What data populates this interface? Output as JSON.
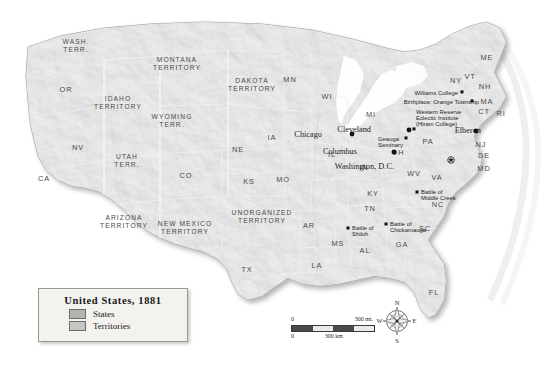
{
  "map": {
    "title": "United States, 1881",
    "legend": {
      "title": "United States,  1881",
      "items": [
        {
          "label": "States",
          "color": "#b3b3b3"
        },
        {
          "label": "Territories",
          "color": "#c6c6c6"
        }
      ]
    },
    "scale": {
      "miles_zero": "0",
      "miles_value": "300 mi.",
      "km_zero": "0",
      "km_value": "300 km"
    },
    "compass": {
      "north": "N",
      "east": "E",
      "south": "S",
      "west": "W"
    },
    "states": [
      {
        "abbr": "OR",
        "x": 66,
        "y": 92
      },
      {
        "abbr": "CA",
        "x": 44,
        "y": 181
      },
      {
        "abbr": "NV",
        "x": 78,
        "y": 150
      },
      {
        "abbr": "MN",
        "x": 290,
        "y": 82
      },
      {
        "abbr": "WI",
        "x": 327,
        "y": 99
      },
      {
        "abbr": "MI",
        "x": 371,
        "y": 117
      },
      {
        "abbr": "IA",
        "x": 272,
        "y": 140
      },
      {
        "abbr": "NE",
        "x": 238,
        "y": 152
      },
      {
        "abbr": "CO",
        "x": 186,
        "y": 178
      },
      {
        "abbr": "KS",
        "x": 249,
        "y": 184
      },
      {
        "abbr": "MO",
        "x": 283,
        "y": 182
      },
      {
        "abbr": "IL",
        "x": 332,
        "y": 157
      },
      {
        "abbr": "IN",
        "x": 364,
        "y": 170
      },
      {
        "abbr": "OH",
        "x": 398,
        "y": 155
      },
      {
        "abbr": "PA",
        "x": 428,
        "y": 144
      },
      {
        "abbr": "KY",
        "x": 373,
        "y": 196
      },
      {
        "abbr": "TN",
        "x": 370,
        "y": 211
      },
      {
        "abbr": "AR",
        "x": 309,
        "y": 228
      },
      {
        "abbr": "MS",
        "x": 338,
        "y": 246
      },
      {
        "abbr": "AL",
        "x": 365,
        "y": 253
      },
      {
        "abbr": "GA",
        "x": 402,
        "y": 247
      },
      {
        "abbr": "SC",
        "x": 425,
        "y": 231
      },
      {
        "abbr": "NC",
        "x": 438,
        "y": 207
      },
      {
        "abbr": "VA",
        "x": 437,
        "y": 180
      },
      {
        "abbr": "WV",
        "x": 414,
        "y": 176
      },
      {
        "abbr": "LA",
        "x": 317,
        "y": 268
      },
      {
        "abbr": "TX",
        "x": 247,
        "y": 272
      },
      {
        "abbr": "FL",
        "x": 434,
        "y": 295
      },
      {
        "abbr": "ME",
        "x": 487,
        "y": 60
      },
      {
        "abbr": "VT",
        "x": 470,
        "y": 79
      },
      {
        "abbr": "NH",
        "x": 485,
        "y": 89
      },
      {
        "abbr": "NY",
        "x": 456,
        "y": 83
      },
      {
        "abbr": "MA",
        "x": 487,
        "y": 104
      },
      {
        "abbr": "CT",
        "x": 484,
        "y": 114
      },
      {
        "abbr": "RI",
        "x": 501,
        "y": 116
      },
      {
        "abbr": "NJ",
        "x": 481,
        "y": 147
      },
      {
        "abbr": "DE",
        "x": 484,
        "y": 158
      },
      {
        "abbr": "MD",
        "x": 484,
        "y": 171
      }
    ],
    "territories": [
      {
        "lines": [
          "WASH.",
          "TERR."
        ],
        "x": 76,
        "y": 44
      },
      {
        "lines": [
          "MONTANA",
          "TERRITORY"
        ],
        "x": 177,
        "y": 62
      },
      {
        "lines": [
          "DAKOTA",
          "TERRITORY"
        ],
        "x": 252,
        "y": 83
      },
      {
        "lines": [
          "IDAHO",
          "TERRITORY"
        ],
        "x": 118,
        "y": 101
      },
      {
        "lines": [
          "WYOMING",
          "TERR."
        ],
        "x": 172,
        "y": 119
      },
      {
        "lines": [
          "UTAH",
          "TERR."
        ],
        "x": 127,
        "y": 159
      },
      {
        "lines": [
          "ARIZONA",
          "TERRITORY"
        ],
        "x": 124,
        "y": 220
      },
      {
        "lines": [
          "NEW MEXICO",
          "TERRITORY"
        ],
        "x": 185,
        "y": 226
      },
      {
        "lines": [
          "UNORGANIZED",
          "TERRITORY"
        ],
        "x": 262,
        "y": 215
      }
    ],
    "cities": [
      {
        "name": "Chicago",
        "label_x": 322,
        "label_y": 137,
        "dot_x": 352,
        "dot_y": 134,
        "anchor": "start",
        "marker": "dot"
      },
      {
        "name": "Cleveland",
        "label_x": 371,
        "label_y": 132,
        "dot_x": 409,
        "dot_y": 130,
        "anchor": "start",
        "marker": "dot"
      },
      {
        "name": "Columbus",
        "label_x": 357,
        "label_y": 154,
        "dot_x": 394,
        "dot_y": 152,
        "anchor": "start",
        "marker": "dot"
      },
      {
        "name": "Washington, D.C.",
        "label_x": 394,
        "label_y": 169,
        "dot_x": 451,
        "dot_y": 160,
        "anchor": "start",
        "marker": "star"
      },
      {
        "name": "Elberon",
        "label_x": 481,
        "label_y": 133,
        "dot_x": 476,
        "dot_y": 131,
        "anchor": "start",
        "marker": "dot"
      }
    ],
    "annotations": [
      {
        "lines": [
          "Williams College"
        ],
        "x": 458,
        "y": 95,
        "anchor": "end",
        "dot_x": 462,
        "dot_y": 95
      },
      {
        "lines": [
          "Birthplace: Orange Township"
        ],
        "x": 479,
        "y": 104,
        "anchor": "end",
        "dot_x": 472,
        "dot_y": 104
      },
      {
        "lines": [
          "Western Reserve",
          "Eclectic Institute",
          "(Hiram College)"
        ],
        "x": 416,
        "y": 114,
        "anchor": "start",
        "dot_x": 414,
        "dot_y": 132
      },
      {
        "lines": [
          "Geauga",
          "Seminary"
        ],
        "x": 378,
        "y": 141,
        "anchor": "start",
        "dot_x": 406,
        "dot_y": 141
      }
    ],
    "battles": [
      {
        "lines": [
          "Battle of",
          "Middle Creek"
        ],
        "x": 421,
        "y": 194,
        "dot_x": 417,
        "dot_y": 192
      },
      {
        "lines": [
          "Battle of",
          "Shiloh"
        ],
        "x": 352,
        "y": 230,
        "dot_x": 348,
        "dot_y": 228
      },
      {
        "lines": [
          "Battle of",
          "Chickamauga"
        ],
        "x": 390,
        "y": 226,
        "dot_x": 386,
        "dot_y": 224
      }
    ]
  }
}
